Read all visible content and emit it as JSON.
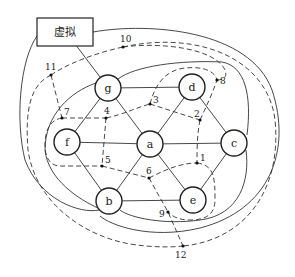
{
  "diagram": {
    "type": "planar-graph-with-dual",
    "box": {
      "label": "虚拟",
      "x": 37,
      "y": 18,
      "w": 56,
      "h": 28
    },
    "nodes": [
      {
        "id": "g",
        "label": "g",
        "cx": 108,
        "cy": 88
      },
      {
        "id": "d",
        "label": "d",
        "cx": 192,
        "cy": 87
      },
      {
        "id": "f",
        "label": "f",
        "cx": 67,
        "cy": 142
      },
      {
        "id": "a",
        "label": "a",
        "cx": 150,
        "cy": 144
      },
      {
        "id": "c",
        "label": "c",
        "cx": 234,
        "cy": 143
      },
      {
        "id": "b",
        "label": "b",
        "cx": 109,
        "cy": 201
      },
      {
        "id": "e",
        "label": "e",
        "cx": 193,
        "cy": 200
      }
    ],
    "node_radius": 13,
    "edges": [
      [
        "g",
        "d"
      ],
      [
        "g",
        "f"
      ],
      [
        "g",
        "a"
      ],
      [
        "d",
        "a"
      ],
      [
        "d",
        "c"
      ],
      [
        "f",
        "a"
      ],
      [
        "a",
        "c"
      ],
      [
        "f",
        "b"
      ],
      [
        "a",
        "b"
      ],
      [
        "a",
        "e"
      ],
      [
        "b",
        "e"
      ],
      [
        "c",
        "e"
      ],
      [
        "box",
        "g"
      ]
    ],
    "dual_points": [
      {
        "id": "1",
        "label": "1",
        "x": 197,
        "y": 163
      },
      {
        "id": "2",
        "label": "2",
        "x": 200,
        "y": 120
      },
      {
        "id": "3",
        "label": "3",
        "x": 150,
        "y": 104
      },
      {
        "id": "4",
        "label": "4",
        "x": 106,
        "y": 118
      },
      {
        "id": "5",
        "label": "5",
        "x": 102,
        "y": 166
      },
      {
        "id": "6",
        "label": "6",
        "x": 149,
        "y": 178
      },
      {
        "id": "7",
        "label": "7",
        "x": 62,
        "y": 118
      },
      {
        "id": "8",
        "label": "8",
        "x": 217,
        "y": 80
      },
      {
        "id": "9",
        "label": "9",
        "x": 168,
        "y": 212
      },
      {
        "id": "10",
        "label": "10",
        "x": 123,
        "y": 47
      },
      {
        "id": "11",
        "label": "11",
        "x": 51,
        "y": 75
      },
      {
        "id": "12",
        "label": "12",
        "x": 183,
        "y": 246
      }
    ]
  }
}
